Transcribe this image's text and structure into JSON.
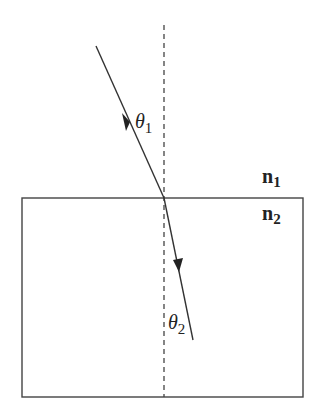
{
  "diagram": {
    "labels": {
      "theta1": "θ",
      "theta1_sub": "1",
      "theta2": "θ",
      "theta2_sub": "2",
      "n1": "n",
      "n1_sub": "1",
      "n2": "n",
      "n2_sub": "2"
    },
    "colors": {
      "line": "#333333",
      "background": "#ffffff"
    }
  }
}
